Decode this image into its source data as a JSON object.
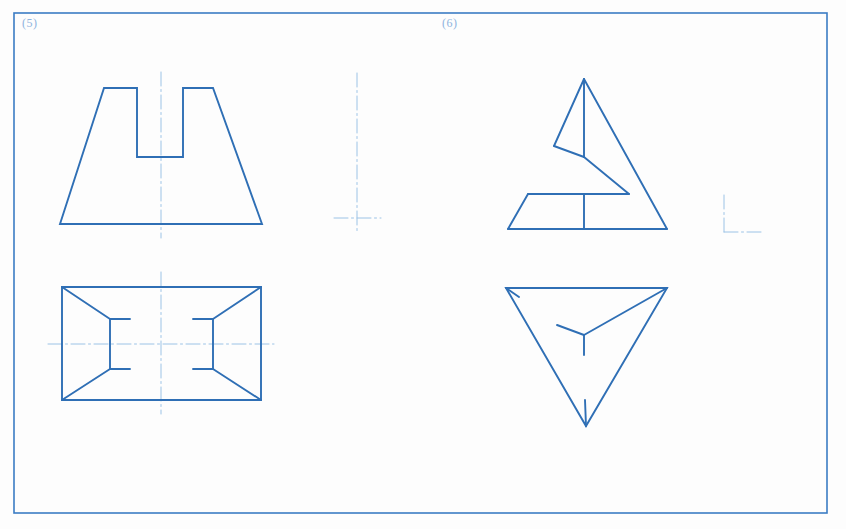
{
  "page": {
    "background": "#fdfdfd",
    "width": 846,
    "height": 529,
    "line_color": "#2f6fb5",
    "centerline_color": "#9cc3e6",
    "label_color": "#8fb4dd",
    "border_color": "#3b7cc4"
  },
  "border": {
    "x": 14,
    "y": 13,
    "width": 813,
    "height": 500,
    "stroke_width": 1.6
  },
  "labels": [
    {
      "name": "problem-5",
      "text": "(5)",
      "x": 22,
      "y": 16
    },
    {
      "name": "problem-6",
      "text": "(6)",
      "x": 442,
      "y": 16
    }
  ],
  "chart_data": {
    "type": "diagram",
    "notation": "SVG polyline/line point lists in screenshot pixel coordinates",
    "stroke_widths": {
      "object_line": 1.9,
      "center_line": 1.0,
      "border": 1.6
    },
    "figures": [
      {
        "id": "p5-front-view",
        "label": "Problem 5 front view: notched trapezoid",
        "shapes": [
          {
            "kind": "polyline",
            "name": "notched-trapezoid-outline",
            "closed": true,
            "points": "60,224 104,88 137,88 137,157 183,157 183,88 213,88 262,224"
          }
        ],
        "centerlines": [
          {
            "kind": "line",
            "name": "vertical-centerline",
            "x1": 161,
            "y1": 72,
            "x2": 161,
            "y2": 238
          }
        ]
      },
      {
        "id": "p5-side-view",
        "label": "Problem 5 side view: centerline cross",
        "shapes": [],
        "centerlines": [
          {
            "kind": "line",
            "name": "vertical-centerline",
            "x1": 357,
            "y1": 73,
            "x2": 357,
            "y2": 233
          },
          {
            "kind": "line",
            "name": "horizontal-centerline",
            "x1": 334,
            "y1": 218,
            "x2": 381,
            "y2": 218
          }
        ]
      },
      {
        "id": "p5-top-view",
        "label": "Problem 5 top view: rectangle with converging diagonals",
        "shapes": [
          {
            "kind": "polyline",
            "name": "outer-rectangle",
            "closed": true,
            "points": "62,287 261,287 261,400 62,400"
          },
          {
            "kind": "line",
            "name": "left-diagonal-upper",
            "x1": 62,
            "y1": 287,
            "x2": 110,
            "y2": 319
          },
          {
            "kind": "line",
            "name": "left-diagonal-lower",
            "x1": 62,
            "y1": 400,
            "x2": 110,
            "y2": 369
          },
          {
            "kind": "line",
            "name": "left-vertical-segment",
            "x1": 110,
            "y1": 319,
            "x2": 110,
            "y2": 369
          },
          {
            "kind": "line",
            "name": "left-stub-upper",
            "x1": 110,
            "y1": 319,
            "x2": 130,
            "y2": 319
          },
          {
            "kind": "line",
            "name": "left-stub-lower",
            "x1": 110,
            "y1": 369,
            "x2": 130,
            "y2": 369
          },
          {
            "kind": "line",
            "name": "right-diagonal-upper",
            "x1": 261,
            "y1": 287,
            "x2": 213,
            "y2": 319
          },
          {
            "kind": "line",
            "name": "right-diagonal-lower",
            "x1": 261,
            "y1": 400,
            "x2": 213,
            "y2": 369
          },
          {
            "kind": "line",
            "name": "right-vertical-segment",
            "x1": 213,
            "y1": 319,
            "x2": 213,
            "y2": 369
          },
          {
            "kind": "line",
            "name": "right-stub-upper",
            "x1": 213,
            "y1": 319,
            "x2": 193,
            "y2": 319
          },
          {
            "kind": "line",
            "name": "right-stub-lower",
            "x1": 213,
            "y1": 369,
            "x2": 193,
            "y2": 369
          }
        ],
        "centerlines": [
          {
            "kind": "line",
            "name": "vertical-centerline",
            "x1": 161,
            "y1": 272,
            "x2": 161,
            "y2": 414
          },
          {
            "kind": "line",
            "name": "horizontal-centerline",
            "x1": 48,
            "y1": 344,
            "x2": 274,
            "y2": 344
          }
        ]
      },
      {
        "id": "p6-front-view",
        "label": "Problem 6 front view: triangle with zigzag and base trapezoid",
        "shapes": [
          {
            "kind": "line",
            "name": "apex-left-edge",
            "x1": 584,
            "y1": 79,
            "x2": 554,
            "y2": 146
          },
          {
            "kind": "line",
            "name": "apex-vertical",
            "x1": 584,
            "y1": 79,
            "x2": 584,
            "y2": 157
          },
          {
            "kind": "line",
            "name": "apex-right-edge",
            "x1": 584,
            "y1": 79,
            "x2": 667,
            "y2": 229
          },
          {
            "kind": "line",
            "name": "upper-fold-left",
            "x1": 554,
            "y1": 146,
            "x2": 584,
            "y2": 157
          },
          {
            "kind": "line",
            "name": "zigzag-diagonal",
            "x1": 584,
            "y1": 157,
            "x2": 629,
            "y2": 194
          },
          {
            "kind": "line",
            "name": "base-top-edge",
            "x1": 528,
            "y1": 194,
            "x2": 629,
            "y2": 194
          },
          {
            "kind": "line",
            "name": "base-left-slope",
            "x1": 528,
            "y1": 194,
            "x2": 508,
            "y2": 229
          },
          {
            "kind": "line",
            "name": "base-bottom-edge",
            "x1": 508,
            "y1": 229,
            "x2": 667,
            "y2": 229
          },
          {
            "kind": "line",
            "name": "base-vertical-divider",
            "x1": 584,
            "y1": 194,
            "x2": 584,
            "y2": 229
          }
        ],
        "centerlines": []
      },
      {
        "id": "p6-top-view",
        "label": "Problem 6 top view: inverted triangle with Y branches",
        "shapes": [
          {
            "kind": "polyline",
            "name": "inverted-triangle-outline",
            "closed": true,
            "points": "506,288 667,288 586,426"
          },
          {
            "kind": "line",
            "name": "y-branch-to-right-corner",
            "x1": 584,
            "y1": 335,
            "x2": 667,
            "y2": 288
          },
          {
            "kind": "line",
            "name": "y-branch-upper-left",
            "x1": 584,
            "y1": 335,
            "x2": 557,
            "y2": 325
          },
          {
            "kind": "line",
            "name": "y-branch-down",
            "x1": 584,
            "y1": 335,
            "x2": 584,
            "y2": 355
          },
          {
            "kind": "line",
            "name": "left-corner-tick",
            "x1": 506,
            "y1": 288,
            "x2": 519,
            "y2": 297
          },
          {
            "kind": "line",
            "name": "bottom-vertex-tick",
            "x1": 586,
            "y1": 426,
            "x2": 585,
            "y2": 400
          }
        ],
        "centerlines": []
      },
      {
        "id": "p6-side-view",
        "label": "Problem 6 side view: L-shaped corner mark",
        "shapes": [],
        "centerlines": [
          {
            "kind": "line",
            "name": "l-vertical-arm",
            "x1": 724,
            "y1": 195,
            "x2": 724,
            "y2": 232
          },
          {
            "kind": "line",
            "name": "l-horizontal-arm",
            "x1": 724,
            "y1": 232,
            "x2": 763,
            "y2": 232
          }
        ]
      }
    ]
  }
}
